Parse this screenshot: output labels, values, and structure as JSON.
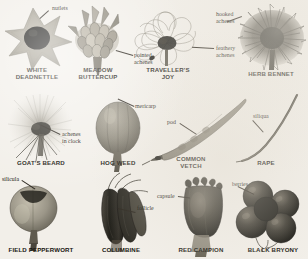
{
  "plate": {
    "background_color": "#f2efe9",
    "ink_color": "#17150f",
    "width": 308,
    "height": 259
  },
  "specimens": [
    {
      "id": "white-deadnettle",
      "caption": "WHITE\nDEADNETTLE",
      "annotation": "nutlets",
      "fruit_type": "nutlets",
      "row": 1,
      "column": 1
    },
    {
      "id": "meadow-buttercup",
      "caption": "MEADOW\nBUTTERCUP",
      "annotation": "pointed\nachenes",
      "fruit_type": "achenes",
      "row": 1,
      "column": 2
    },
    {
      "id": "travellers-joy",
      "caption": "TRAVELLER'S\nJOY",
      "annotation": "feathery\nachenes",
      "fruit_type": "achenes",
      "row": 1,
      "column": 3
    },
    {
      "id": "herb-bennet",
      "caption": "HERB BENNET",
      "annotation": "hooked\nachenes",
      "fruit_type": "achenes",
      "row": 1,
      "column": 4
    },
    {
      "id": "goats-beard",
      "caption": "GOAT'S BEARD",
      "annotation": "achenes\nin clock",
      "fruit_type": "achenes",
      "row": 2,
      "column": 1
    },
    {
      "id": "hog-weed",
      "caption": "HOG WEED",
      "annotation": "mericarp",
      "fruit_type": "mericarp",
      "row": 2,
      "column": 2
    },
    {
      "id": "common-vetch",
      "caption": "COMMON\nVETCH",
      "annotation": "pod",
      "fruit_type": "pod",
      "row": 2,
      "column": 3
    },
    {
      "id": "rape",
      "caption": "RAPE",
      "annotation": "siliqua",
      "fruit_type": "siliqua",
      "row": 2,
      "column": 4
    },
    {
      "id": "field-pepperwort",
      "caption": "FIELD PEPPERWORT",
      "annotation": "silicula",
      "fruit_type": "silicula",
      "row": 3,
      "column": 1
    },
    {
      "id": "columbine",
      "caption": "COLUMBINE",
      "annotation": "follicle",
      "fruit_type": "follicle",
      "row": 3,
      "column": 2
    },
    {
      "id": "red-campion",
      "caption": "RED CAMPION",
      "annotation": "capsule",
      "fruit_type": "capsule",
      "row": 3,
      "column": 3
    },
    {
      "id": "black-bryony",
      "caption": "BLACK BRYONY",
      "annotation": "berries",
      "fruit_type": "berries",
      "row": 3,
      "column": 4
    }
  ]
}
